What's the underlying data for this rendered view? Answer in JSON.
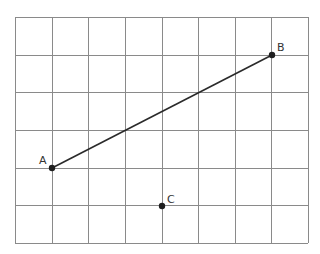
{
  "diagram": {
    "type": "coordinate-grid",
    "grid": {
      "columns": 8,
      "rows": 6,
      "left": 15,
      "top": 17,
      "right": 308,
      "bottom": 243,
      "line_color": "#8a8a8a"
    },
    "points": [
      {
        "label": "A",
        "grid_x": 1,
        "grid_y": 4,
        "px": 52,
        "py": 168
      },
      {
        "label": "B",
        "grid_x": 7,
        "grid_y": 1,
        "px": 272,
        "py": 55
      },
      {
        "label": "C",
        "grid_x": 4,
        "grid_y": 5,
        "px": 162,
        "py": 206
      }
    ],
    "segments": [
      {
        "from": "A",
        "to": "B",
        "color": "#2a2a2a"
      }
    ]
  }
}
